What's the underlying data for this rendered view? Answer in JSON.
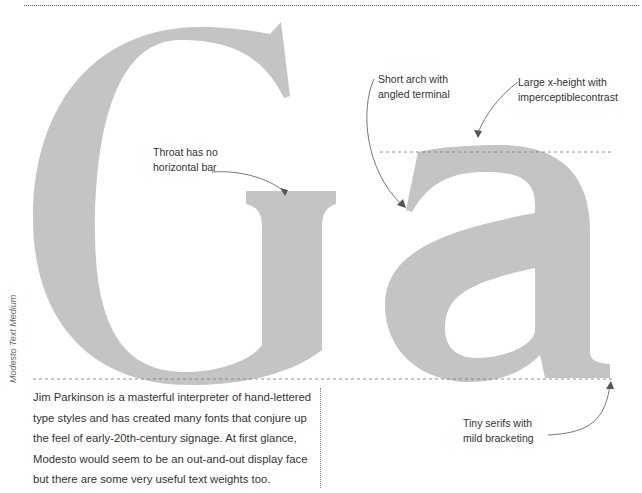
{
  "specimen": {
    "glyphs": "Ga",
    "glyph_color": "#c4c4c4",
    "guide_color": "#777777",
    "typeface_label": "Modesto Text Medium"
  },
  "annotations": [
    {
      "id": "throat",
      "line1": "Throat has no",
      "line2": "horizontal bar"
    },
    {
      "id": "arch",
      "line1": "Short arch with",
      "line2": "angled terminal"
    },
    {
      "id": "xheight",
      "line1": "Large x-height with",
      "line2": "imperceptiblecontrast"
    },
    {
      "id": "serifs",
      "line1": "Tiny serifs with",
      "line2": "mild bracketing"
    }
  ],
  "body": {
    "paragraph": "Jim Parkinson is a masterful interpreter of hand-lettered type styles and has created many fonts that conjure up the feel of early-20th-century signage. At first glance, Modesto would seem to be an out-and-out display face but there are some very useful text weights too."
  }
}
